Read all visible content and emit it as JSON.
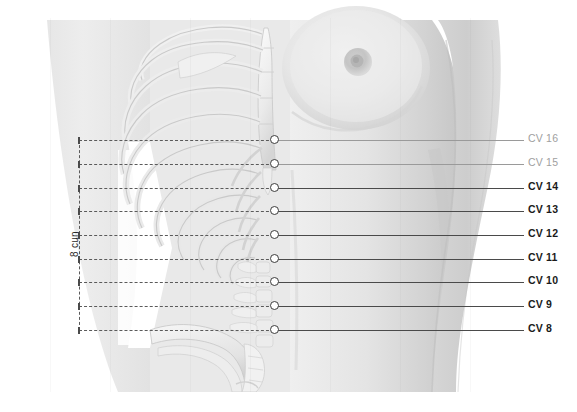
{
  "measurement": {
    "label": "8 cun",
    "bracket_top_y": 140,
    "bracket_bottom_y": 330,
    "divisions": 8
  },
  "colors": {
    "background": "#ffffff",
    "skin_light": "#e8e8e8",
    "skin_mid": "#d8d8d8",
    "skin_shadow": "#c4c4c4",
    "bone_light": "#f2f2f2",
    "bone_shadow": "#cfcfcf",
    "leader_line": "#4a4a4a",
    "leader_line_faint": "#9a9a9a",
    "label_text": "#1a1a1a",
    "label_text_faint": "#a0a0a0",
    "marker_fill": "#ffffff",
    "marker_stroke": "#3c3c3c",
    "dashed_guide": "#5a5a5a"
  },
  "points": [
    {
      "label": "CV 16",
      "y": 140,
      "marker_x": 274,
      "leader_end_x": 524,
      "label_x": 528,
      "faint": true,
      "tick": true
    },
    {
      "label": "CV 15",
      "y": 164,
      "marker_x": 274,
      "leader_end_x": 524,
      "label_x": 528,
      "faint": true,
      "tick": true
    },
    {
      "label": "CV 14",
      "y": 188,
      "marker_x": 274,
      "leader_end_x": 524,
      "label_x": 528,
      "faint": false,
      "tick": true
    },
    {
      "label": "CV 13",
      "y": 211,
      "marker_x": 274,
      "leader_end_x": 524,
      "label_x": 528,
      "faint": false,
      "tick": true
    },
    {
      "label": "CV 12",
      "y": 235,
      "marker_x": 274,
      "leader_end_x": 524,
      "label_x": 528,
      "faint": false,
      "tick": true
    },
    {
      "label": "CV 11",
      "y": 259,
      "marker_x": 274,
      "leader_end_x": 524,
      "label_x": 528,
      "faint": false,
      "tick": true
    },
    {
      "label": "CV 10",
      "y": 282,
      "marker_x": 274,
      "leader_end_x": 524,
      "label_x": 528,
      "faint": false,
      "tick": true
    },
    {
      "label": "CV 9",
      "y": 306,
      "marker_x": 274,
      "leader_end_x": 524,
      "label_x": 528,
      "faint": false,
      "tick": true
    },
    {
      "label": "CV 8",
      "y": 330,
      "marker_x": 274,
      "leader_end_x": 524,
      "label_x": 528,
      "faint": false,
      "tick": true
    }
  ]
}
